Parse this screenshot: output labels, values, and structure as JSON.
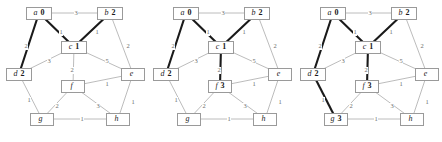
{
  "figure": {
    "caption": "",
    "panel_count": 3,
    "colors": {
      "edge_normal": "#b4b4b4",
      "edge_highlight": "#1a1a1a",
      "node_border": "#9a9a9a",
      "node_fill": "#ffffff",
      "weight_text": "#6d6d6d",
      "label_text": "#1a1a1a",
      "background": "#ffffff"
    },
    "graph": {
      "node_ids": [
        "a",
        "b",
        "c",
        "d",
        "e",
        "f",
        "g",
        "h"
      ],
      "positions": {
        "a": {
          "x": 39,
          "y": 13
        },
        "b": {
          "x": 110,
          "y": 13
        },
        "c": {
          "x": 74,
          "y": 47
        },
        "d": {
          "x": 19,
          "y": 74
        },
        "e": {
          "x": 133,
          "y": 74
        },
        "f": {
          "x": 73,
          "y": 86
        },
        "g": {
          "x": 42,
          "y": 119
        },
        "h": {
          "x": 118,
          "y": 119
        }
      },
      "edges": [
        {
          "id": "a-b",
          "from": "a",
          "to": "b",
          "weight": "3",
          "lx": 74,
          "ly": 10
        },
        {
          "id": "a-c",
          "from": "a",
          "to": "c",
          "weight": "1",
          "lx": 59,
          "ly": 29
        },
        {
          "id": "a-d",
          "from": "a",
          "to": "d",
          "weight": "2",
          "lx": 24,
          "ly": 43
        },
        {
          "id": "b-c",
          "from": "b",
          "to": "c",
          "weight": "1",
          "lx": 95,
          "ly": 29
        },
        {
          "id": "b-e",
          "from": "b",
          "to": "e",
          "weight": "2",
          "lx": 126,
          "ly": 43
        },
        {
          "id": "c-d",
          "from": "c",
          "to": "d",
          "weight": "3",
          "lx": 47,
          "ly": 58
        },
        {
          "id": "c-e",
          "from": "c",
          "to": "e",
          "weight": "5",
          "lx": 105,
          "ly": 58
        },
        {
          "id": "c-f",
          "from": "c",
          "to": "f",
          "weight": "2",
          "lx": 70,
          "ly": 67
        },
        {
          "id": "d-g",
          "from": "d",
          "to": "g",
          "weight": "1",
          "lx": 27,
          "ly": 97
        },
        {
          "id": "e-f",
          "from": "e",
          "to": "f",
          "weight": "1",
          "lx": 105,
          "ly": 81
        },
        {
          "id": "e-h",
          "from": "e",
          "to": "h",
          "weight": "1",
          "lx": 131,
          "ly": 99
        },
        {
          "id": "f-g",
          "from": "f",
          "to": "g",
          "weight": "2",
          "lx": 55,
          "ly": 103
        },
        {
          "id": "f-h",
          "from": "f",
          "to": "h",
          "weight": "3",
          "lx": 96,
          "ly": 103
        },
        {
          "id": "g-h",
          "from": "g",
          "to": "h",
          "weight": "1",
          "lx": 80,
          "ly": 116
        }
      ]
    },
    "panels": [
      {
        "id": "panel-1",
        "offset_x": 0,
        "labels": {
          "a": "0",
          "b": "2",
          "c": "1",
          "d": "2",
          "e": "",
          "f": "",
          "g": "",
          "h": ""
        },
        "highlighted_edges": [
          "a-c",
          "b-c",
          "a-d"
        ]
      },
      {
        "id": "panel-2",
        "offset_x": 147,
        "labels": {
          "a": "0",
          "b": "2",
          "c": "1",
          "d": "2",
          "e": "",
          "f": "3",
          "g": "",
          "h": ""
        },
        "highlighted_edges": [
          "a-c",
          "b-c",
          "a-d",
          "c-f"
        ]
      },
      {
        "id": "panel-3",
        "offset_x": 294,
        "labels": {
          "a": "0",
          "b": "2",
          "c": "1",
          "d": "2",
          "e": "",
          "f": "3",
          "g": "3",
          "h": ""
        },
        "highlighted_edges": [
          "a-c",
          "b-c",
          "a-d",
          "c-f",
          "d-g"
        ]
      }
    ]
  }
}
